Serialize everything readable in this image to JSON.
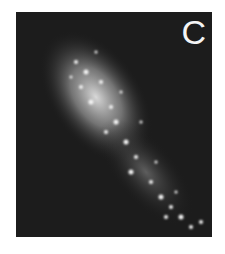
{
  "figure": {
    "panel_label": "C",
    "colors": {
      "background": "#1c1c1c",
      "signal": "#e8e8e8",
      "label": "#f4f4f4"
    }
  }
}
